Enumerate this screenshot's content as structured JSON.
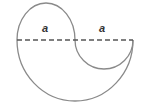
{
  "diagram": {
    "labels": [
      {
        "id": "left-radius-label",
        "text": "a"
      },
      {
        "id": "right-radius-label",
        "text": "a"
      }
    ],
    "colors": {
      "outline": "#8a8a8a",
      "dashed_line": "#555555",
      "label": "#333333",
      "background": "#ffffff"
    }
  }
}
